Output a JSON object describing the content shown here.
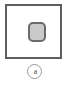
{
  "figure": {
    "panel_frame": {
      "name": "panel-frame",
      "border_color": "#5e5e5e",
      "background_color": "#ffffff"
    },
    "shape": {
      "name": "rounded-square-shape",
      "fill_color": "#c9c9c9",
      "border_color": "#6b6b6b"
    },
    "label": {
      "text": "a",
      "circle_border_color": "#9a9a9a",
      "text_color": "#4a4a4a"
    },
    "background_color": "#ffffff"
  }
}
